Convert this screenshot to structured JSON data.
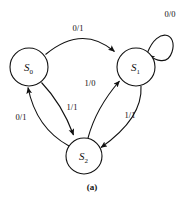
{
  "figure": {
    "caption": "(a)",
    "type": "state-transition-diagram"
  },
  "states": [
    {
      "id": "S0",
      "base": "S",
      "sub": "0",
      "cx": 29,
      "cy": 67,
      "r": 19
    },
    {
      "id": "S1",
      "base": "S",
      "sub": "1",
      "cx": 136,
      "cy": 67,
      "r": 19
    },
    {
      "id": "S2",
      "base": "S",
      "sub": "2",
      "cx": 84,
      "cy": 156,
      "r": 18
    }
  ],
  "transitions": [
    {
      "from": "S0",
      "to": "S1",
      "label": "0/1",
      "label_x": 78,
      "label_y": 31
    },
    {
      "from": "S1",
      "to": "S1",
      "label": "0/0",
      "label_x": 170,
      "label_y": 17
    },
    {
      "from": "S0",
      "to": "S2",
      "label": "1/1",
      "label_x": 72,
      "label_y": 110
    },
    {
      "from": "S2",
      "to": "S0",
      "label": "0/1",
      "label_x": 21,
      "label_y": 120
    },
    {
      "from": "S2",
      "to": "S1",
      "label": "1/0",
      "label_x": 90,
      "label_y": 86
    },
    {
      "from": "S1",
      "to": "S2",
      "label": "1/1",
      "label_x": 130,
      "label_y": 118
    }
  ],
  "colors": {
    "ink": "#111111",
    "background": "#ffffff"
  }
}
